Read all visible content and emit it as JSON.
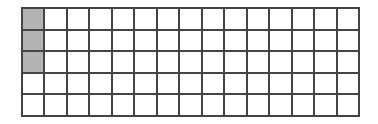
{
  "grid": {
    "rows": 5,
    "columns": 15,
    "total_cells": 75,
    "shaded_cells": [
      {
        "row": 0,
        "col": 0
      },
      {
        "row": 1,
        "col": 0
      },
      {
        "row": 2,
        "col": 0
      }
    ],
    "shaded_count": 3,
    "colors": {
      "shaded": "#b3b3b3",
      "empty": "#ffffff",
      "line": "#444444"
    }
  }
}
